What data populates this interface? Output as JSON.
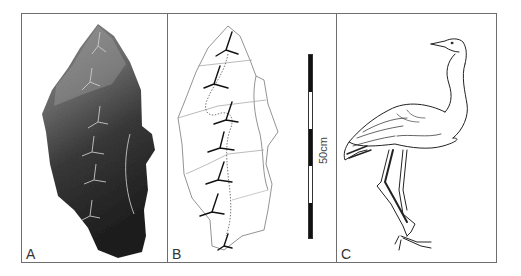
{
  "figure": {
    "panels": [
      {
        "id": "A",
        "label": "A",
        "content": "photograph of stone slab with bird footprint trackway"
      },
      {
        "id": "B",
        "label": "B",
        "content": "line tracing of slab showing six footprints"
      },
      {
        "id": "C",
        "label": "C",
        "content": "line drawing of a crane-like bird"
      }
    ],
    "scale_bar": {
      "label": "50cm",
      "segments": [
        "black",
        "white",
        "black",
        "white",
        "black"
      ]
    },
    "colors": {
      "frame": "#6e6e6e",
      "slab_dark": "#2a2a2a",
      "slab_mid": "#5a5a5a",
      "slab_light": "#9a9a9a",
      "line": "#222222"
    }
  }
}
